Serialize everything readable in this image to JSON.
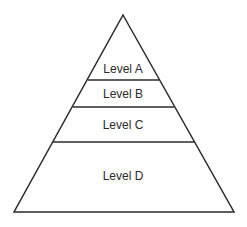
{
  "diagram": {
    "type": "pyramid",
    "levels": [
      {
        "label": "Level A",
        "position": "top"
      },
      {
        "label": "Level B",
        "position": "second"
      },
      {
        "label": "Level C",
        "position": "third"
      },
      {
        "label": "Level D",
        "position": "bottom"
      }
    ],
    "colors": {
      "stroke": "#2a2a2a",
      "fill": "#ffffff",
      "text": "#2a2a2a"
    }
  }
}
